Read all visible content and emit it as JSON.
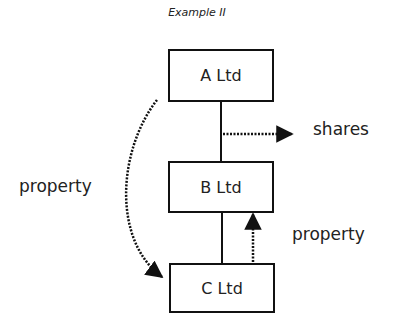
{
  "title": "Example II",
  "nodes": [
    {
      "id": "a",
      "label": "A Ltd"
    },
    {
      "id": "b",
      "label": "B Ltd"
    },
    {
      "id": "c",
      "label": "C Ltd"
    }
  ],
  "edges": [
    {
      "from": "A Ltd",
      "to": "B Ltd",
      "style": "solid"
    },
    {
      "from": "B Ltd",
      "to": "C Ltd",
      "style": "solid"
    }
  ],
  "flows": [
    {
      "from": "A Ltd",
      "to": "C Ltd",
      "style": "dotted-curved-arrow",
      "label": "property"
    },
    {
      "from": "A-B link",
      "to": "outside",
      "style": "dotted-arrow",
      "label": "shares"
    },
    {
      "from": "C Ltd",
      "to": "B Ltd",
      "style": "dotted-arrow",
      "label": "property"
    }
  ],
  "colors": {
    "stroke": "#111111",
    "text": "#222222",
    "background": "#ffffff"
  }
}
